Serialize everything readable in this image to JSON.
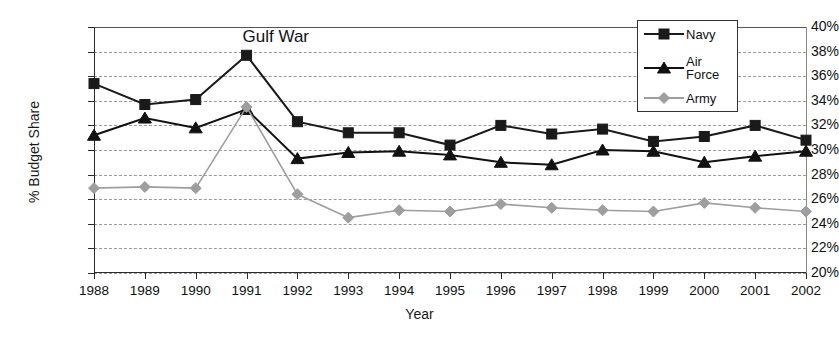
{
  "chart_data": {
    "type": "line",
    "title": "",
    "xlabel": "Year",
    "ylabel": "% Budget Share",
    "categories": [
      "1988",
      "1989",
      "1990",
      "1991",
      "1992",
      "1993",
      "1994",
      "1995",
      "1996",
      "1997",
      "1998",
      "1999",
      "2000",
      "2001",
      "2002"
    ],
    "x": [
      1988,
      1989,
      1990,
      1991,
      1992,
      1993,
      1994,
      1995,
      1996,
      1997,
      1998,
      1999,
      2000,
      2001,
      2002
    ],
    "ylim": [
      20,
      40
    ],
    "ytick_labels": [
      "40%",
      "38%",
      "36%",
      "34%",
      "32%",
      "30%",
      "28%",
      "26%",
      "24%",
      "22%",
      "20%"
    ],
    "ytick_values": [
      40,
      38,
      36,
      34,
      32,
      30,
      28,
      26,
      24,
      22,
      20
    ],
    "grid": true,
    "legend_position": "top-right",
    "series": [
      {
        "name": "Navy",
        "marker": "square",
        "color": "#1a1a1a",
        "values": [
          35.4,
          33.7,
          34.1,
          37.7,
          32.3,
          31.4,
          31.4,
          30.4,
          32.0,
          31.3,
          31.7,
          30.7,
          31.1,
          32.0,
          30.8
        ]
      },
      {
        "name": "Air Force",
        "marker": "triangle",
        "color": "#111111",
        "values": [
          31.2,
          32.6,
          31.8,
          33.3,
          29.3,
          29.8,
          29.9,
          29.6,
          29.0,
          28.8,
          30.0,
          29.9,
          29.0,
          29.5,
          29.9
        ]
      },
      {
        "name": "Army",
        "marker": "diamond",
        "color": "#9e9e9e",
        "values": [
          26.9,
          27.0,
          26.9,
          33.5,
          26.4,
          24.5,
          25.1,
          25.0,
          25.6,
          25.3,
          25.1,
          25.0,
          25.7,
          25.3,
          25.0
        ]
      }
    ],
    "annotations": [
      {
        "text": "Gulf War",
        "x": 1991,
        "y": 39.2
      }
    ]
  },
  "legend": {
    "entries": [
      {
        "label": "Navy"
      },
      {
        "label": "Air\nForce"
      },
      {
        "label": "Army"
      }
    ]
  },
  "axes": {
    "y_title": "% Budget Share",
    "x_title": "Year"
  }
}
